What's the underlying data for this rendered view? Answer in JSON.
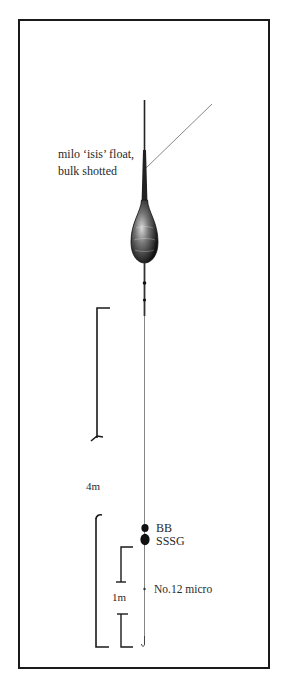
{
  "diagram": {
    "float_label": {
      "line1": "milo ‘isis’ float,",
      "line2": "bulk shotted"
    },
    "depth_label": "4m",
    "shot_labels": {
      "bb": "BB",
      "sssg": "SSSG"
    },
    "micro_label": "No.12 micro",
    "spacing_label": "1m",
    "colors": {
      "ink": "#1a1a1a",
      "line": "#555555",
      "background": "#ffffff"
    }
  }
}
